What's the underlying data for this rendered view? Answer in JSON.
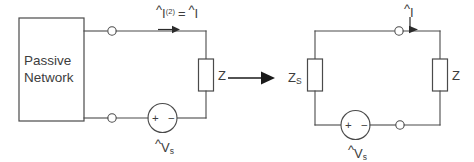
{
  "figure": {
    "type": "circuit-equivalence-diagram",
    "background_color": "#ffffff",
    "line_color": "#4a4a4a",
    "text_color": "#3d3d3d",
    "transition_arrow": "→"
  },
  "left_circuit": {
    "name": "passive-network-with-load",
    "block_label": "Passive\nNetwork",
    "current_label": {
      "symbol": "I",
      "hat": "^",
      "superscript": "(2)",
      "equals": "=",
      "symbol_right": "I",
      "hat_right": "^",
      "full_text": "Î⁽²⁾ = Î"
    },
    "impedance_label": {
      "symbol": "Z",
      "subscript": ""
    },
    "source_label": {
      "symbol": "V",
      "hat": "^",
      "subscript": "s"
    },
    "source_polarity": {
      "plus": "+",
      "minus": "−"
    },
    "terminals": [
      "top-terminal-node",
      "bottom-terminal-node"
    ]
  },
  "right_circuit": {
    "name": "thevenin-equivalent-source-with-load",
    "source_impedance_label": {
      "symbol": "Z",
      "subscript": "S"
    },
    "load_impedance_label": {
      "symbol": "Z",
      "subscript": ""
    },
    "current_label": {
      "symbol": "I",
      "hat": "^",
      "superscript": "",
      "full_text": "Î"
    },
    "source_label": {
      "symbol": "V",
      "hat": "^",
      "subscript": "s"
    },
    "source_polarity": {
      "plus": "+",
      "minus": "−"
    },
    "terminals": [
      "top-terminal-node",
      "bottom-terminal-node"
    ]
  }
}
